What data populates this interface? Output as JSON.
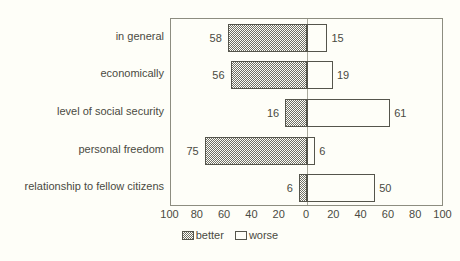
{
  "chart_data": {
    "type": "bar",
    "orientation": "horizontal",
    "layout": "diverging",
    "title": "",
    "subtitle": "",
    "xlabel": "",
    "ylabel": "",
    "grid": false,
    "legend_position": "bottom-center",
    "xlim": [
      -100,
      100
    ],
    "xticks": [
      100,
      80,
      60,
      40,
      20,
      0,
      20,
      40,
      60,
      80,
      100
    ],
    "xtick_labels": [
      "100",
      "80",
      "60",
      "40",
      "20",
      "0",
      "20",
      "40",
      "60",
      "80",
      "100"
    ],
    "xtick_positions": [
      -100,
      -80,
      -60,
      -40,
      -20,
      0,
      20,
      40,
      60,
      80,
      100
    ],
    "categories": [
      "in general",
      "economically",
      "level of social security",
      "personal freedom",
      "relationship to fellow citizens"
    ],
    "series": [
      {
        "name": "better",
        "direction": "left",
        "fill": "checkerboard-gray",
        "values": [
          58,
          56,
          16,
          75,
          6
        ]
      },
      {
        "name": "worse",
        "direction": "right",
        "fill": "white",
        "values": [
          15,
          19,
          61,
          6,
          50
        ]
      }
    ],
    "data_labels": {
      "better": [
        "58",
        "56",
        "16",
        "75",
        "6"
      ],
      "worse": [
        "15",
        "19",
        "61",
        "6",
        "50"
      ]
    }
  },
  "legend": {
    "items": [
      {
        "label": "better",
        "swatch": "checkerboard-gray"
      },
      {
        "label": "worse",
        "swatch": "white"
      }
    ]
  },
  "colors": {
    "background": "#fefef8",
    "axis_border": "#8d8d80",
    "bar_border": "#55554c",
    "better_fill": "#6f6f66",
    "worse_fill": "#fefef8",
    "text": "#4a4a42",
    "zero_line": "#a9a99c"
  }
}
